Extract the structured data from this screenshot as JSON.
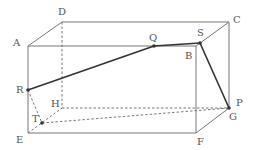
{
  "diagram": {
    "type": "rectangular-prism",
    "colors": {
      "edge": "#777777",
      "path": "#333333",
      "hidden": "#777777"
    },
    "vertices": {
      "A": [
        28,
        46
      ],
      "B": [
        196,
        46
      ],
      "C": [
        229,
        22
      ],
      "D": [
        62,
        22
      ],
      "E": [
        28,
        133
      ],
      "F": [
        196,
        133
      ],
      "G": [
        229,
        108
      ],
      "H": [
        62,
        108
      ]
    },
    "points": {
      "P": [
        229,
        108
      ],
      "Q": [
        154,
        46
      ],
      "R": [
        28,
        90
      ],
      "S": [
        200,
        43
      ],
      "T": [
        42,
        123
      ]
    },
    "labels": [
      {
        "id": "A",
        "text": "A",
        "x": 13,
        "y": 38
      },
      {
        "id": "D",
        "text": "D",
        "x": 58,
        "y": 7
      },
      {
        "id": "Q",
        "text": "Q",
        "x": 149,
        "y": 33
      },
      {
        "id": "S",
        "text": "S",
        "x": 197,
        "y": 28
      },
      {
        "id": "C",
        "text": "C",
        "x": 233,
        "y": 15
      },
      {
        "id": "B",
        "text": "B",
        "x": 185,
        "y": 51
      },
      {
        "id": "R",
        "text": "R",
        "x": 16,
        "y": 85
      },
      {
        "id": "H",
        "text": "H",
        "x": 51,
        "y": 99
      },
      {
        "id": "T",
        "text": "T",
        "x": 32,
        "y": 114
      },
      {
        "id": "E",
        "text": "E",
        "x": 16,
        "y": 135
      },
      {
        "id": "P",
        "text": "P",
        "x": 236,
        "y": 98
      },
      {
        "id": "G",
        "text": "G",
        "x": 229,
        "y": 112
      },
      {
        "id": "F",
        "text": "F",
        "x": 197,
        "y": 137
      }
    ]
  }
}
